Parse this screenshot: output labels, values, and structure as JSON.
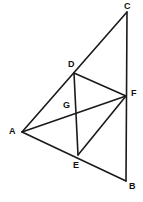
{
  "figure": {
    "kind": "geometry-diagram",
    "width": 143,
    "height": 202,
    "background_color": "#ffffff",
    "stroke_color": "#1a1a1a",
    "stroke_width": 1.6,
    "label_color": "#111111"
  },
  "points": {
    "A": {
      "name": "A",
      "x": 22,
      "y": 132,
      "label_x": 9,
      "label_y": 127
    },
    "B": {
      "name": "B",
      "x": 126,
      "y": 181,
      "label_x": 129,
      "label_y": 182
    },
    "C": {
      "name": "C",
      "x": 127,
      "y": 12,
      "label_x": 124,
      "label_y": 2
    },
    "D": {
      "name": "D",
      "x": 74,
      "y": 73,
      "label_x": 68,
      "label_y": 60
    },
    "E": {
      "name": "E",
      "x": 78,
      "y": 155,
      "label_x": 73,
      "label_y": 161
    },
    "F": {
      "name": "F",
      "x": 126,
      "y": 96,
      "label_x": 131,
      "label_y": 89
    },
    "G": {
      "name": "G",
      "x": 76,
      "y": 110,
      "label_x": 63,
      "label_y": 101
    }
  },
  "segments": [
    {
      "id": "A-C",
      "from": "A",
      "to": "C",
      "note": "passes through D"
    },
    {
      "id": "C-B",
      "from": "C",
      "to": "B",
      "note": "passes through F"
    },
    {
      "id": "A-B",
      "from": "A",
      "to": "B",
      "note": "passes through E"
    },
    {
      "id": "D-E",
      "from": "D",
      "to": "E",
      "note": "passes through G"
    },
    {
      "id": "A-F",
      "from": "A",
      "to": "F",
      "note": "passes through G"
    },
    {
      "id": "D-F",
      "from": "D",
      "to": "F",
      "note": ""
    },
    {
      "id": "E-F",
      "from": "E",
      "to": "F",
      "note": ""
    }
  ]
}
